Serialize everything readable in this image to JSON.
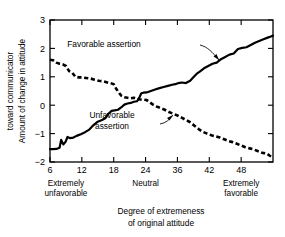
{
  "chart_data": {
    "type": "line",
    "title": "",
    "xlabel": [
      "Degree of extremeness",
      "of original attitude"
    ],
    "ylabel": [
      "Amount of change in attitude",
      "toward communicator"
    ],
    "xlim": [
      6,
      48
    ],
    "ylim": [
      -2,
      3
    ],
    "grid": false,
    "legend_position": "inline-annotations",
    "xticks": [
      {
        "value": 6,
        "label": "6"
      },
      {
        "value": 12,
        "label": "12"
      },
      {
        "value": 18,
        "label": "18"
      },
      {
        "value": 24,
        "label": "24"
      },
      {
        "value": 30,
        "label": "36"
      },
      {
        "value": 36,
        "label": "42"
      },
      {
        "value": 42,
        "label": "48"
      }
    ],
    "xticks_display": [
      "6",
      "12",
      "18",
      "24",
      "36",
      "42",
      "48"
    ],
    "yticks": [
      {
        "value": 3,
        "label": "3"
      },
      {
        "value": 2,
        "label": "2"
      },
      {
        "value": 1,
        "label": "1"
      },
      {
        "value": 0,
        "label": "0"
      },
      {
        "value": -1,
        "label": "−1"
      },
      {
        "value": -2,
        "label": "−2"
      }
    ],
    "yticks_display": [
      "3",
      "2",
      "1",
      "0",
      "−1",
      "−2"
    ],
    "category_labels": [
      {
        "text_line1": "Extremely",
        "text_line2": "unfavorable",
        "at": 9
      },
      {
        "text_line1": "Neutral",
        "text_line2": "",
        "at": 24
      },
      {
        "text_line1": "Extremely",
        "text_line2": "favorable",
        "at": 42
      }
    ],
    "series": [
      {
        "name": "Favorable assertion",
        "style": "solid",
        "color": "#000000",
        "x": [
          6,
          6.6,
          7.2,
          7.8,
          8.1,
          8.5,
          8.9,
          9.3,
          9.8,
          10.4,
          11,
          11.8,
          12.6,
          13.4,
          14.2,
          15,
          15.8,
          16.4,
          17,
          17.6,
          18.2,
          18.8,
          19.4,
          20,
          20.6,
          21.2,
          21.8,
          22.4,
          22.9,
          23.2,
          23.6,
          24.2,
          25,
          25.8,
          26.6,
          27.4,
          28.2,
          29,
          29.6,
          30.2,
          30.8,
          31.6,
          32.4,
          33,
          33.6,
          34.2,
          35,
          35.8,
          36.6,
          37.4,
          38.2,
          39,
          39.8,
          40.6,
          41.4,
          42.2,
          43,
          43.8,
          44.6,
          45.4,
          46.2,
          47,
          47.6,
          48
        ],
        "y": [
          -1.55,
          -1.55,
          -1.54,
          -1.5,
          -1.22,
          -1.38,
          -1.3,
          -1.12,
          -1.16,
          -1.14,
          -1.08,
          -1.02,
          -0.95,
          -0.86,
          -0.7,
          -0.58,
          -0.52,
          -0.46,
          -0.3,
          -0.2,
          -0.18,
          -0.16,
          -0.08,
          0.02,
          0.06,
          0.08,
          0.12,
          0.14,
          0.3,
          0.42,
          0.44,
          0.45,
          0.5,
          0.55,
          0.6,
          0.64,
          0.68,
          0.72,
          0.74,
          0.78,
          0.8,
          0.78,
          0.86,
          0.98,
          1.1,
          1.18,
          1.3,
          1.38,
          1.46,
          1.5,
          1.62,
          1.7,
          1.78,
          1.82,
          1.98,
          2.02,
          2.04,
          2.12,
          2.2,
          2.26,
          2.32,
          2.38,
          2.42,
          2.45
        ]
      },
      {
        "name": "Unfavorable assertion",
        "style": "dashed",
        "color": "#000000",
        "x": [
          6,
          6.6,
          7.2,
          7.8,
          8.4,
          9,
          9.6,
          10.2,
          10.8,
          11.4,
          12,
          12.8,
          13.6,
          14.4,
          15.2,
          16,
          16.8,
          17.4,
          18,
          18.4,
          18.9,
          19.4,
          20,
          20.6,
          21.2,
          21.8,
          22.4,
          23,
          23.6,
          24.2,
          24.8,
          25.4,
          26,
          26.8,
          27.6,
          28.4,
          29.2,
          30,
          30.8,
          31.6,
          32.4,
          33.2,
          34,
          34.8,
          35.6,
          36.4,
          37.2,
          38,
          38.8,
          39.6,
          40.4,
          41.2,
          42,
          42.8,
          43.6,
          44.4,
          45.2,
          46,
          46.8,
          47.4,
          48
        ],
        "y": [
          1.6,
          1.58,
          1.5,
          1.46,
          1.44,
          1.38,
          1.2,
          1.14,
          1.0,
          0.98,
          0.98,
          0.96,
          0.94,
          0.9,
          0.86,
          0.84,
          0.8,
          0.78,
          0.74,
          0.6,
          0.46,
          0.34,
          0.28,
          0.26,
          0.24,
          0.26,
          0.22,
          0.2,
          0.2,
          0.18,
          0.1,
          0.02,
          -0.04,
          -0.1,
          -0.16,
          -0.24,
          -0.3,
          -0.36,
          -0.44,
          -0.52,
          -0.6,
          -0.72,
          -0.84,
          -0.94,
          -1.0,
          -1.06,
          -1.1,
          -1.14,
          -1.2,
          -1.26,
          -1.3,
          -1.36,
          -1.42,
          -1.48,
          -1.52,
          -1.56,
          -1.62,
          -1.68,
          -1.7,
          -1.78,
          -1.85
        ]
      }
    ],
    "annotations": [
      {
        "name": "favorable-assertion-label",
        "text_line1": "Favorable assertion",
        "text_line2": "",
        "text_x": 104,
        "text_y": 47,
        "leader": "M 200 45 C 208 47, 212 52, 219 60",
        "arrow": "M 219 60 L 213.5 56.5 L 216.5 54 Z"
      },
      {
        "name": "unfavorable-assertion-label",
        "text_line1": "Unfavorable",
        "text_line2": "assertion",
        "text_x": 112,
        "text_y": 118,
        "leader": "M 160 124 C 166 123, 169 120, 173 115",
        "arrow": "M 173 115 L 169.5 120.5 L 167 118 Z"
      }
    ]
  },
  "plot_geometry": {
    "left": 50,
    "right": 273,
    "top": 20,
    "bottom": 162
  }
}
